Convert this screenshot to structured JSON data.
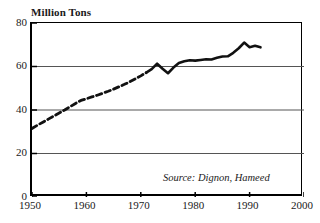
{
  "chart_data": {
    "type": "line",
    "title": "",
    "ylabel": "Million Tons",
    "xlabel": "",
    "xlim": [
      1950,
      2000
    ],
    "ylim": [
      0,
      80
    ],
    "grid": true,
    "legend": null,
    "x_ticks": [
      "1950",
      "1960",
      "1970",
      "1980",
      "1990",
      "2000"
    ],
    "x_tick_values": [
      1950,
      1960,
      1970,
      1980,
      1990,
      2000
    ],
    "y_ticks": [
      "0",
      "20",
      "40",
      "60",
      "80"
    ],
    "y_tick_values": [
      0,
      20,
      40,
      60,
      80
    ],
    "series": [
      {
        "name": "Estimated (dashed)",
        "style": "dashed",
        "x": [
          1950,
          1951,
          1952,
          1953,
          1954,
          1955,
          1956,
          1957,
          1958,
          1959,
          1960,
          1961,
          1962,
          1963,
          1964,
          1965,
          1966,
          1967,
          1968,
          1969,
          1970,
          1971
        ],
        "values": [
          31.5,
          33.0,
          34.4,
          35.8,
          37.2,
          38.6,
          40.0,
          41.5,
          43.0,
          44.4,
          45.2,
          46.0,
          46.8,
          47.7,
          48.6,
          49.6,
          50.7,
          51.8,
          53.0,
          54.3,
          55.7,
          57.2
        ]
      },
      {
        "name": "Measured (solid)",
        "style": "solid",
        "x": [
          1971,
          1972,
          1973,
          1974,
          1975,
          1976,
          1977,
          1978,
          1979,
          1980,
          1981,
          1982,
          1983,
          1984,
          1985,
          1986,
          1987,
          1988,
          1989,
          1990,
          1991,
          1992
        ],
        "values": [
          57.2,
          58.8,
          61.3,
          59.0,
          56.9,
          59.5,
          61.6,
          62.4,
          62.9,
          62.7,
          63.0,
          63.3,
          63.2,
          64.0,
          64.6,
          64.7,
          66.3,
          68.4,
          71.0,
          68.9,
          69.5,
          68.8
        ]
      }
    ],
    "annotations": [
      {
        "name": "source-note",
        "text": "Source: Dignon, Hameed"
      }
    ],
    "colors": {
      "line": "#111111",
      "grid": "#555555",
      "axis": "#000000",
      "background": "#ffffff"
    }
  },
  "axis_title": "Million Tons",
  "source_note": "Source: Dignon, Hameed"
}
